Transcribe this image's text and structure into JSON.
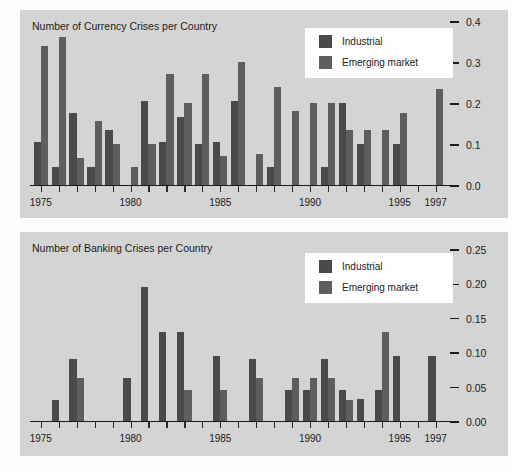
{
  "chart_data": [
    {
      "type": "bar",
      "id": "currency-crises",
      "title": "Number of Currency Crises per Country",
      "xlabel": "",
      "ylabel": "",
      "ylim": [
        0.0,
        0.4
      ],
      "yticks": [
        "0.0",
        "0.1",
        "0.2",
        "0.3",
        "0.4"
      ],
      "ytick_values": [
        0.0,
        0.1,
        0.2,
        0.3,
        0.4
      ],
      "xlim": [
        1974.4,
        1997.8
      ],
      "xtick_years": [
        1975,
        1976,
        1977,
        1978,
        1979,
        1980,
        1981,
        1982,
        1983,
        1984,
        1985,
        1986,
        1987,
        1988,
        1989,
        1990,
        1991,
        1992,
        1993,
        1994,
        1995,
        1996,
        1997
      ],
      "xtick_labels": [
        {
          "year": 1975,
          "label": "1975"
        },
        {
          "year": 1980,
          "label": "1980"
        },
        {
          "year": 1985,
          "label": "1985"
        },
        {
          "year": 1990,
          "label": "1990"
        },
        {
          "year": 1995,
          "label": "1995"
        },
        {
          "year": 1997,
          "label": "1997"
        }
      ],
      "grid": false,
      "legend_position": "top-right",
      "series": [
        {
          "name": "Industrial",
          "color": "#4a4a4a",
          "points": [
            {
              "year": 1975,
              "value": 0.105
            },
            {
              "year": 1976,
              "value": 0.045
            },
            {
              "year": 1977,
              "value": 0.175
            },
            {
              "year": 1978,
              "value": 0.045
            },
            {
              "year": 1979,
              "value": 0.135
            },
            {
              "year": 1980,
              "value": 0.0
            },
            {
              "year": 1981,
              "value": 0.205
            },
            {
              "year": 1982,
              "value": 0.105
            },
            {
              "year": 1983,
              "value": 0.165
            },
            {
              "year": 1984,
              "value": 0.1
            },
            {
              "year": 1985,
              "value": 0.105
            },
            {
              "year": 1986,
              "value": 0.205
            },
            {
              "year": 1987,
              "value": 0.0
            },
            {
              "year": 1988,
              "value": 0.045
            },
            {
              "year": 1989,
              "value": 0.0
            },
            {
              "year": 1990,
              "value": 0.0
            },
            {
              "year": 1991,
              "value": 0.045
            },
            {
              "year": 1992,
              "value": 0.2
            },
            {
              "year": 1993,
              "value": 0.1
            },
            {
              "year": 1994,
              "value": 0.0
            },
            {
              "year": 1995,
              "value": 0.1
            },
            {
              "year": 1996,
              "value": 0.0
            },
            {
              "year": 1997,
              "value": 0.0
            }
          ]
        },
        {
          "name": "Emerging market",
          "color": "#5e5e5e",
          "points": [
            {
              "year": 1975,
              "value": 0.34
            },
            {
              "year": 1976,
              "value": 0.36
            },
            {
              "year": 1977,
              "value": 0.065
            },
            {
              "year": 1978,
              "value": 0.155
            },
            {
              "year": 1979,
              "value": 0.1
            },
            {
              "year": 1980,
              "value": 0.045
            },
            {
              "year": 1981,
              "value": 0.1
            },
            {
              "year": 1982,
              "value": 0.27
            },
            {
              "year": 1983,
              "value": 0.2
            },
            {
              "year": 1984,
              "value": 0.27
            },
            {
              "year": 1985,
              "value": 0.07
            },
            {
              "year": 1986,
              "value": 0.3
            },
            {
              "year": 1987,
              "value": 0.075
            },
            {
              "year": 1988,
              "value": 0.24
            },
            {
              "year": 1989,
              "value": 0.18
            },
            {
              "year": 1990,
              "value": 0.2
            },
            {
              "year": 1991,
              "value": 0.2
            },
            {
              "year": 1992,
              "value": 0.135
            },
            {
              "year": 1993,
              "value": 0.135
            },
            {
              "year": 1994,
              "value": 0.135
            },
            {
              "year": 1995,
              "value": 0.175
            },
            {
              "year": 1996,
              "value": 0.0
            },
            {
              "year": 1997,
              "value": 0.235
            }
          ]
        }
      ]
    },
    {
      "type": "bar",
      "id": "banking-crises",
      "title": "Number of Banking Crises per Country",
      "xlabel": "",
      "ylabel": "",
      "ylim": [
        0.0,
        0.25
      ],
      "yticks": [
        "0.00",
        "0.05",
        "0.10",
        "0.15",
        "0.20",
        "0.25"
      ],
      "ytick_values": [
        0.0,
        0.05,
        0.1,
        0.15,
        0.2,
        0.25
      ],
      "xlim": [
        1974.4,
        1997.8
      ],
      "xtick_years": [
        1975,
        1976,
        1977,
        1978,
        1979,
        1980,
        1981,
        1982,
        1983,
        1984,
        1985,
        1986,
        1987,
        1988,
        1989,
        1990,
        1991,
        1992,
        1993,
        1994,
        1995,
        1996,
        1997
      ],
      "xtick_labels": [
        {
          "year": 1975,
          "label": "1975"
        },
        {
          "year": 1980,
          "label": "1980"
        },
        {
          "year": 1985,
          "label": "1985"
        },
        {
          "year": 1990,
          "label": "1990"
        },
        {
          "year": 1995,
          "label": "1995"
        },
        {
          "year": 1997,
          "label": "1997"
        }
      ],
      "grid": false,
      "legend_position": "top-right",
      "series": [
        {
          "name": "Industrial",
          "color": "#4a4a4a",
          "points": [
            {
              "year": 1975,
              "value": 0.0
            },
            {
              "year": 1976,
              "value": 0.03
            },
            {
              "year": 1977,
              "value": 0.09
            },
            {
              "year": 1978,
              "value": 0.0
            },
            {
              "year": 1979,
              "value": 0.0
            },
            {
              "year": 1980,
              "value": 0.062
            },
            {
              "year": 1981,
              "value": 0.195
            },
            {
              "year": 1982,
              "value": 0.13
            },
            {
              "year": 1983,
              "value": 0.13
            },
            {
              "year": 1984,
              "value": 0.0
            },
            {
              "year": 1985,
              "value": 0.095
            },
            {
              "year": 1986,
              "value": 0.0
            },
            {
              "year": 1987,
              "value": 0.09
            },
            {
              "year": 1988,
              "value": 0.0
            },
            {
              "year": 1989,
              "value": 0.045
            },
            {
              "year": 1990,
              "value": 0.045
            },
            {
              "year": 1991,
              "value": 0.09
            },
            {
              "year": 1992,
              "value": 0.045
            },
            {
              "year": 1993,
              "value": 0.032
            },
            {
              "year": 1994,
              "value": 0.045
            },
            {
              "year": 1995,
              "value": 0.095
            },
            {
              "year": 1996,
              "value": 0.0
            },
            {
              "year": 1997,
              "value": 0.095
            }
          ]
        },
        {
          "name": "Emerging market",
          "color": "#5e5e5e",
          "points": [
            {
              "year": 1975,
              "value": 0.0
            },
            {
              "year": 1976,
              "value": 0.0
            },
            {
              "year": 1977,
              "value": 0.063
            },
            {
              "year": 1978,
              "value": 0.0
            },
            {
              "year": 1979,
              "value": 0.0
            },
            {
              "year": 1980,
              "value": 0.0
            },
            {
              "year": 1981,
              "value": 0.0
            },
            {
              "year": 1982,
              "value": 0.0
            },
            {
              "year": 1983,
              "value": 0.045
            },
            {
              "year": 1984,
              "value": 0.0
            },
            {
              "year": 1985,
              "value": 0.045
            },
            {
              "year": 1986,
              "value": 0.0
            },
            {
              "year": 1987,
              "value": 0.063
            },
            {
              "year": 1988,
              "value": 0.0
            },
            {
              "year": 1989,
              "value": 0.063
            },
            {
              "year": 1990,
              "value": 0.063
            },
            {
              "year": 1991,
              "value": 0.063
            },
            {
              "year": 1992,
              "value": 0.03
            },
            {
              "year": 1993,
              "value": 0.0
            },
            {
              "year": 1994,
              "value": 0.13
            },
            {
              "year": 1995,
              "value": 0.0
            },
            {
              "year": 1996,
              "value": 0.0
            },
            {
              "year": 1997,
              "value": 0.0
            }
          ]
        }
      ]
    }
  ],
  "legend": {
    "industrial_label": "Industrial",
    "emerging_label": "Emerging market"
  },
  "colors": {
    "panel_background": "#d4d4d4",
    "industrial": "#4a4a4a",
    "emerging": "#5e5e5e",
    "axis": "#1b1b1b",
    "legend_background": "#ffffff"
  }
}
